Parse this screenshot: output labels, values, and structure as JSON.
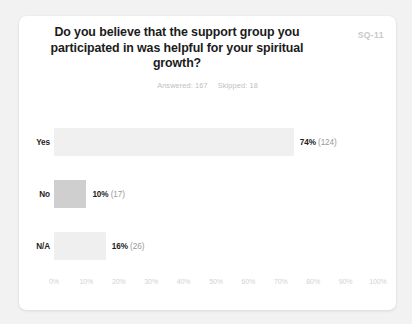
{
  "card": {
    "survey_code": "SQ-11",
    "title": "Do you believe that the support group you participated in was helpful for your spiritual growth?",
    "stats": {
      "answered_label": "Answered: 167",
      "skipped_label": "Skipped: 18"
    }
  },
  "chart_data": {
    "type": "bar",
    "orientation": "horizontal",
    "title": "Do you believe that the support group you participated in was helpful for your spiritual growth?",
    "xlabel": "",
    "ylabel": "",
    "xlim": [
      0,
      100
    ],
    "xticks": [
      "0%",
      "10%",
      "20%",
      "30%",
      "40%",
      "50%",
      "60%",
      "70%",
      "80%",
      "90%",
      "100%"
    ],
    "grid": false,
    "legend": "none",
    "answered": 167,
    "skipped": 18,
    "categories": [
      "Yes",
      "No",
      "N/A"
    ],
    "values": [
      74,
      10,
      16
    ],
    "counts": [
      124,
      17,
      26
    ],
    "value_labels": [
      "74%",
      "10%",
      "16%"
    ],
    "count_labels": [
      "(124)",
      "(17)",
      "(26)"
    ],
    "bar_colors": [
      "#f0f0f0",
      "#cfcfcf",
      "#efefef"
    ]
  }
}
